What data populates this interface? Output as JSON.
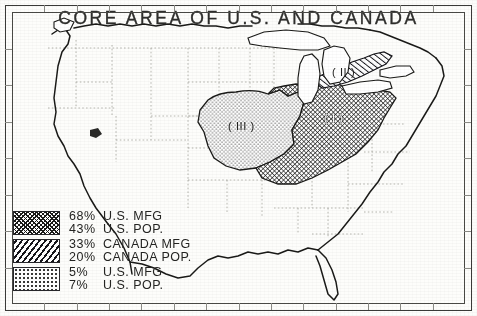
{
  "map": {
    "title": "CORE AREA OF U.S. AND CANADA",
    "regions": [
      {
        "id": "region-1",
        "label": "( I )",
        "pattern": "cross-hatch",
        "name": "U.S. Manufacturing Belt core"
      },
      {
        "id": "region-2",
        "label": "( II )",
        "pattern": "diagonal-hatch",
        "name": "Canadian core corridor"
      },
      {
        "id": "region-3",
        "label": "( III )",
        "pattern": "stipple",
        "name": "Western extension of core area"
      }
    ]
  },
  "legend": {
    "groups": [
      {
        "pattern": "cross-hatch",
        "rows": [
          {
            "percent": "68%",
            "label": "U.S. MFG"
          },
          {
            "percent": "43%",
            "label": "U.S. POP."
          }
        ]
      },
      {
        "pattern": "diagonal-hatch",
        "rows": [
          {
            "percent": "33%",
            "label": "CANADA MFG"
          },
          {
            "percent": "20%",
            "label": "CANADA POP."
          }
        ]
      },
      {
        "pattern": "stipple",
        "rows": [
          {
            "percent": "5%",
            "label": "U.S. MFG"
          },
          {
            "percent": "7%",
            "label": "U.S. POP."
          }
        ]
      }
    ]
  },
  "style": {
    "ink": "#26262a",
    "paper": "#fdfdfb",
    "coastline": "#1a1a18",
    "state_border": "#9a9a95"
  }
}
